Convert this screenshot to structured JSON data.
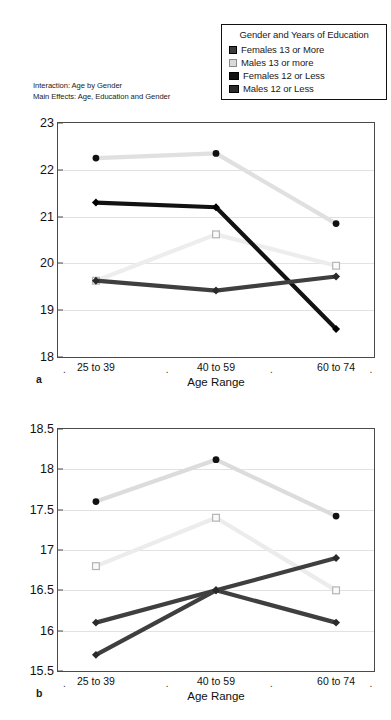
{
  "legend": {
    "title": "Gender and Years of Education",
    "entries": [
      {
        "label": "Females 13 or More",
        "marker": "filled-circle-dark",
        "color": "#3c3c3c"
      },
      {
        "label": "Males 13 or more",
        "marker": "open-square-light",
        "color": "#d9d9d9"
      },
      {
        "label": "Females 12 or Less",
        "marker": "filled-square-black",
        "color": "#111111"
      },
      {
        "label": "Males 12 or Less",
        "marker": "filled-square-dark",
        "color": "#2b2b2b"
      }
    ]
  },
  "notes": {
    "line1": "Interaction: Age by Gender",
    "line2": "Main Effects: Age, Education and Gender"
  },
  "panels": [
    {
      "tag": "a",
      "xlabel": "Age Range"
    },
    {
      "tag": "b",
      "xlabel": "Age Range"
    }
  ],
  "chart_data": [
    {
      "type": "line",
      "panel": "a",
      "title": "",
      "xlabel": "Age Range",
      "ylabel": "",
      "categories": [
        "25 to 39",
        "40 to 59",
        "60 to 74"
      ],
      "ylim": [
        18,
        23
      ],
      "yticks": [
        "18",
        "19",
        "20",
        "21",
        "22",
        "23"
      ],
      "grid": true,
      "legend_position": "top-right",
      "series": [
        {
          "name": "Females 13 or More",
          "values": [
            22.25,
            22.35,
            20.85
          ],
          "color": "#e0e0e0",
          "marker": "circle",
          "marker_color": "#111111"
        },
        {
          "name": "Males 13 or more",
          "values": [
            19.63,
            20.62,
            19.95
          ],
          "color": "#ededed",
          "marker": "square",
          "marker_color": "#b5b5b5"
        },
        {
          "name": "Females 12 or Less",
          "values": [
            21.3,
            21.2,
            18.6
          ],
          "color": "#121212",
          "marker": "diamond",
          "marker_color": "#000000"
        },
        {
          "name": "Males 12 or Less",
          "values": [
            19.63,
            19.42,
            19.72
          ],
          "color": "#3f3f3f",
          "marker": "diamond",
          "marker_color": "#2a2a2a"
        }
      ]
    },
    {
      "type": "line",
      "panel": "b",
      "title": "",
      "xlabel": "Age Range",
      "ylabel": "",
      "categories": [
        "25 to 39",
        "40 to 59",
        "60 to 74"
      ],
      "ylim": [
        15.5,
        18.5
      ],
      "yticks": [
        "15.5",
        "16",
        "16.5",
        "17",
        "17.5",
        "18",
        "18.5"
      ],
      "grid": true,
      "legend_position": "none",
      "series": [
        {
          "name": "Females 13 or More",
          "values": [
            17.6,
            18.12,
            17.42
          ],
          "color": "#dcdcdc",
          "marker": "circle",
          "marker_color": "#111111"
        },
        {
          "name": "Males 13 or more",
          "values": [
            16.8,
            17.4,
            16.5
          ],
          "color": "#ececec",
          "marker": "square",
          "marker_color": "#b5b5b5"
        },
        {
          "name": "Females 12 or Less",
          "values": [
            16.1,
            16.5,
            16.1
          ],
          "color": "#3f3f3f",
          "marker": "diamond",
          "marker_color": "#2a2a2a"
        },
        {
          "name": "Males 12 or Less",
          "values": [
            15.7,
            16.5,
            16.9
          ],
          "color": "#3f3f3f",
          "marker": "diamond",
          "marker_color": "#2a2a2a"
        }
      ]
    }
  ]
}
